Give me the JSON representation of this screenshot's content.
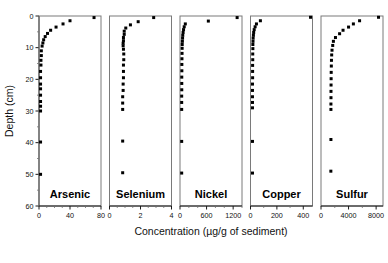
{
  "figure": {
    "xlabel": "Concentration (µg/g of sediment)",
    "ylabel": "Depth (cm)",
    "background_color": "#ffffff",
    "marker_color": "#000000",
    "frame_color": "#7a7a7a"
  },
  "chart_data": {
    "type": "scatter",
    "title": "",
    "xlabel": "Concentration (µg/g of sediment)",
    "ylabel": "Depth (cm)",
    "grid": false,
    "legend": "none",
    "layout": "5 panels side by side, shared y-axis (depth), each with its own x-axis",
    "y_axis": {
      "label": "Depth (cm)",
      "ylim": [
        0,
        60
      ],
      "inverted": true,
      "ticks": [
        0,
        10,
        20,
        30,
        40,
        50,
        60
      ],
      "tick_labels": [
        "0",
        "10",
        "20",
        "30",
        "40",
        "50",
        "60"
      ]
    },
    "panels": [
      {
        "name": "Arsenic",
        "xlim": [
          0,
          80
        ],
        "ticks": [
          0,
          40,
          80
        ],
        "tick_labels": [
          "0",
          "40",
          "80"
        ],
        "minor_ticks": [
          10,
          20,
          30,
          50,
          60,
          70
        ],
        "points": [
          {
            "depth": 0.5,
            "value": 71
          },
          {
            "depth": 1.5,
            "value": 40
          },
          {
            "depth": 2.5,
            "value": 31
          },
          {
            "depth": 3.5,
            "value": 22
          },
          {
            "depth": 4.5,
            "value": 15
          },
          {
            "depth": 5.5,
            "value": 11
          },
          {
            "depth": 6.5,
            "value": 8
          },
          {
            "depth": 7.5,
            "value": 6
          },
          {
            "depth": 8.5,
            "value": 5
          },
          {
            "depth": 9.5,
            "value": 4
          },
          {
            "depth": 11,
            "value": 3
          },
          {
            "depth": 12.5,
            "value": 3
          },
          {
            "depth": 14,
            "value": 2.5
          },
          {
            "depth": 15.5,
            "value": 2.5
          },
          {
            "depth": 17.5,
            "value": 2
          },
          {
            "depth": 19.5,
            "value": 2
          },
          {
            "depth": 21.5,
            "value": 2
          },
          {
            "depth": 23,
            "value": 2
          },
          {
            "depth": 25,
            "value": 2
          },
          {
            "depth": 27,
            "value": 2
          },
          {
            "depth": 28.5,
            "value": 2
          },
          {
            "depth": 30,
            "value": 2
          },
          {
            "depth": 39.8,
            "value": 2
          },
          {
            "depth": 50,
            "value": 2
          }
        ]
      },
      {
        "name": "Selenium",
        "xlim": [
          0,
          4
        ],
        "ticks": [
          0,
          2,
          4
        ],
        "tick_labels": [
          "0",
          "2",
          "4"
        ],
        "minor_ticks": [
          0.5,
          1,
          1.5,
          2.5,
          3,
          3.5
        ],
        "points": [
          {
            "depth": 0.5,
            "value": 2.85
          },
          {
            "depth": 1.8,
            "value": 1.85
          },
          {
            "depth": 2.8,
            "value": 1.35
          },
          {
            "depth": 3.8,
            "value": 1.05
          },
          {
            "depth": 4.8,
            "value": 0.95
          },
          {
            "depth": 5.8,
            "value": 0.95
          },
          {
            "depth": 6.8,
            "value": 0.9
          },
          {
            "depth": 7.8,
            "value": 0.9
          },
          {
            "depth": 8.6,
            "value": 0.88
          },
          {
            "depth": 9.4,
            "value": 0.88
          },
          {
            "depth": 10.5,
            "value": 0.9
          },
          {
            "depth": 12,
            "value": 0.92
          },
          {
            "depth": 13.8,
            "value": 0.92
          },
          {
            "depth": 15.5,
            "value": 0.9
          },
          {
            "depth": 17.5,
            "value": 0.9
          },
          {
            "depth": 19.5,
            "value": 0.9
          },
          {
            "depth": 21.5,
            "value": 0.88
          },
          {
            "depth": 23.5,
            "value": 0.88
          },
          {
            "depth": 25.5,
            "value": 0.85
          },
          {
            "depth": 27.5,
            "value": 0.85
          },
          {
            "depth": 29.5,
            "value": 0.85
          },
          {
            "depth": 39.5,
            "value": 0.85
          },
          {
            "depth": 49.5,
            "value": 0.85
          }
        ]
      },
      {
        "name": "Nickel",
        "xlim": [
          0,
          1400
        ],
        "ticks": [
          0,
          600,
          1200
        ],
        "tick_labels": [
          "0",
          "600",
          "1200"
        ],
        "minor_ticks": [
          200,
          400,
          800,
          1000,
          1400
        ],
        "points": [
          {
            "depth": 0.5,
            "value": 1290
          },
          {
            "depth": 1.6,
            "value": 640
          },
          {
            "depth": 2.5,
            "value": 120
          },
          {
            "depth": 3.4,
            "value": 95
          },
          {
            "depth": 4.3,
            "value": 80
          },
          {
            "depth": 5.2,
            "value": 70
          },
          {
            "depth": 6.1,
            "value": 62
          },
          {
            "depth": 7,
            "value": 58
          },
          {
            "depth": 8,
            "value": 54
          },
          {
            "depth": 9,
            "value": 50
          },
          {
            "depth": 10.2,
            "value": 48
          },
          {
            "depth": 11.8,
            "value": 46
          },
          {
            "depth": 13.5,
            "value": 44
          },
          {
            "depth": 15.3,
            "value": 42
          },
          {
            "depth": 17.3,
            "value": 42
          },
          {
            "depth": 19.3,
            "value": 40
          },
          {
            "depth": 21.3,
            "value": 40
          },
          {
            "depth": 23.3,
            "value": 40
          },
          {
            "depth": 25.3,
            "value": 38
          },
          {
            "depth": 27.3,
            "value": 38
          },
          {
            "depth": 29.5,
            "value": 38
          },
          {
            "depth": 39.6,
            "value": 38
          },
          {
            "depth": 49.6,
            "value": 38
          }
        ]
      },
      {
        "name": "Copper",
        "xlim": [
          0,
          470
        ],
        "ticks": [
          0,
          200,
          400
        ],
        "tick_labels": [
          "0",
          "200",
          "400"
        ],
        "minor_ticks": [
          100,
          300
        ],
        "points": [
          {
            "depth": 0.4,
            "value": 455
          },
          {
            "depth": 1.5,
            "value": 75
          },
          {
            "depth": 2.5,
            "value": 45
          },
          {
            "depth": 3.4,
            "value": 35
          },
          {
            "depth": 4.3,
            "value": 28
          },
          {
            "depth": 5.2,
            "value": 24
          },
          {
            "depth": 6.1,
            "value": 22
          },
          {
            "depth": 7,
            "value": 20
          },
          {
            "depth": 8,
            "value": 19
          },
          {
            "depth": 9,
            "value": 18
          },
          {
            "depth": 10.3,
            "value": 18
          },
          {
            "depth": 12,
            "value": 17
          },
          {
            "depth": 13.8,
            "value": 17
          },
          {
            "depth": 15.6,
            "value": 16
          },
          {
            "depth": 17.5,
            "value": 16
          },
          {
            "depth": 19.5,
            "value": 16
          },
          {
            "depth": 21.5,
            "value": 15
          },
          {
            "depth": 23.5,
            "value": 15
          },
          {
            "depth": 25.5,
            "value": 15
          },
          {
            "depth": 27.3,
            "value": 15
          },
          {
            "depth": 29,
            "value": 15
          },
          {
            "depth": 39.6,
            "value": 15
          },
          {
            "depth": 49.6,
            "value": 15
          }
        ]
      },
      {
        "name": "Sulfur",
        "xlim": [
          0,
          9000
        ],
        "ticks": [
          0,
          4000,
          8000
        ],
        "tick_labels": [
          "0",
          "4000",
          "8000"
        ],
        "minor_ticks": [
          2000,
          6000
        ],
        "points": [
          {
            "depth": 0.4,
            "value": 8350
          },
          {
            "depth": 1.5,
            "value": 5600
          },
          {
            "depth": 2.5,
            "value": 4700
          },
          {
            "depth": 3.5,
            "value": 4000
          },
          {
            "depth": 4.5,
            "value": 3200
          },
          {
            "depth": 5.6,
            "value": 2700
          },
          {
            "depth": 6.8,
            "value": 2100
          },
          {
            "depth": 8,
            "value": 1800
          },
          {
            "depth": 9.3,
            "value": 1700
          },
          {
            "depth": 10.8,
            "value": 1600
          },
          {
            "depth": 12.3,
            "value": 1550
          },
          {
            "depth": 14,
            "value": 1520
          },
          {
            "depth": 15.8,
            "value": 1500
          },
          {
            "depth": 17.8,
            "value": 1480
          },
          {
            "depth": 19.8,
            "value": 1470
          },
          {
            "depth": 21.8,
            "value": 1460
          },
          {
            "depth": 23.8,
            "value": 1450
          },
          {
            "depth": 25.8,
            "value": 1450
          },
          {
            "depth": 27.8,
            "value": 1440
          },
          {
            "depth": 29.5,
            "value": 1440
          },
          {
            "depth": 39,
            "value": 1440
          },
          {
            "depth": 49,
            "value": 1430
          }
        ]
      }
    ]
  }
}
